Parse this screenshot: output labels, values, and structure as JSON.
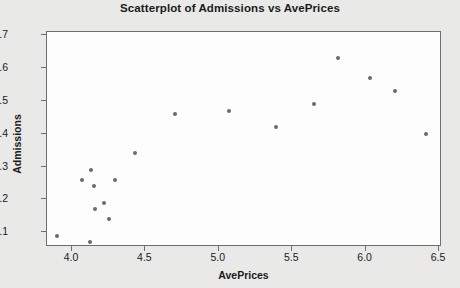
{
  "chart_data": {
    "type": "scatter",
    "title": "Scatterplot of Admissions vs AvePrices",
    "xlabel": "AvePrices",
    "ylabel": "Admissions",
    "xlim": [
      3.83,
      6.52
    ],
    "ylim": [
      1.055,
      1.71
    ],
    "grid": false,
    "legend": null,
    "xticks": [
      "4.0",
      "4.5",
      "5.0",
      "5.5",
      "6.0",
      "6.5"
    ],
    "xtick_values": [
      4.0,
      4.5,
      5.0,
      5.5,
      6.0,
      6.5
    ],
    "yticks": [
      "1.1",
      "1.2",
      "1.3",
      "1.4",
      "1.5",
      "1.6",
      "1.7"
    ],
    "ytick_values": [
      1.1,
      1.2,
      1.3,
      1.4,
      1.5,
      1.6,
      1.7
    ],
    "marker_color": "#6a6a72",
    "plot_background": "#fdfdfd",
    "figure_background": "#e9e9e7",
    "points": [
      {
        "x": 3.9,
        "y": 1.09
      },
      {
        "x": 4.07,
        "y": 1.26
      },
      {
        "x": 4.12,
        "y": 1.07
      },
      {
        "x": 4.13,
        "y": 1.29
      },
      {
        "x": 4.15,
        "y": 1.24
      },
      {
        "x": 4.16,
        "y": 1.17
      },
      {
        "x": 4.22,
        "y": 1.19
      },
      {
        "x": 4.25,
        "y": 1.14
      },
      {
        "x": 4.29,
        "y": 1.26
      },
      {
        "x": 4.43,
        "y": 1.34
      },
      {
        "x": 4.7,
        "y": 1.46
      },
      {
        "x": 5.07,
        "y": 1.47
      },
      {
        "x": 5.39,
        "y": 1.42
      },
      {
        "x": 5.65,
        "y": 1.49
      },
      {
        "x": 5.81,
        "y": 1.63
      },
      {
        "x": 6.03,
        "y": 1.57
      },
      {
        "x": 6.2,
        "y": 1.53
      },
      {
        "x": 6.41,
        "y": 1.4
      }
    ]
  }
}
